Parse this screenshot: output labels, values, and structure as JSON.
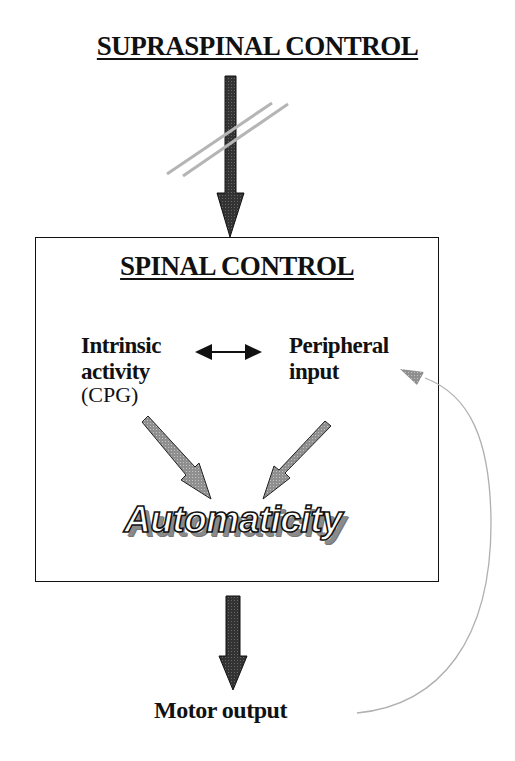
{
  "diagram": {
    "top_title": "SUPRASPINAL CONTROL",
    "box_title": "SPINAL CONTROL",
    "nodes": {
      "intrinsic": {
        "line1": "Intrinsic",
        "line2": "activity",
        "line3": "(CPG)"
      },
      "peripheral": {
        "line1": "Peripheral",
        "line2": "input"
      },
      "automaticity": "Automaticity",
      "motor_output": "Motor output"
    },
    "connections": [
      {
        "from": "supraspinal-control",
        "to": "spinal-control",
        "style": "interrupted (double slash)"
      },
      {
        "from": "intrinsic-activity",
        "to": "peripheral-input",
        "style": "bidirectional"
      },
      {
        "from": "intrinsic-activity",
        "to": "automaticity",
        "style": "gray arrow"
      },
      {
        "from": "peripheral-input",
        "to": "automaticity",
        "style": "gray arrow"
      },
      {
        "from": "spinal-control",
        "to": "motor-output",
        "style": "dark arrow"
      },
      {
        "from": "motor-output",
        "to": "peripheral-input",
        "style": "feedback curve"
      }
    ],
    "colors": {
      "dark_arrow": "#3a3a3a",
      "gray_arrow": "#9a9a9a",
      "slash": "#b5b5b5",
      "feedback": "#b0b0b0"
    }
  }
}
